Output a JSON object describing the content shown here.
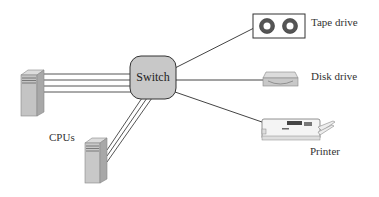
{
  "diagram": {
    "switch": {
      "label": "Switch",
      "fill": "#c8c8c8"
    },
    "cpus": {
      "label": "CPUs",
      "count": 2,
      "links_per_cpu": [
        4,
        3
      ]
    },
    "devices": [
      {
        "id": "tape",
        "label": "Tape drive"
      },
      {
        "id": "disk",
        "label": "Disk drive"
      },
      {
        "id": "printer",
        "label": "Printer"
      }
    ],
    "colors": {
      "line": "#444444",
      "device_fill": "#c8c8c8",
      "background": "#ffffff"
    }
  }
}
